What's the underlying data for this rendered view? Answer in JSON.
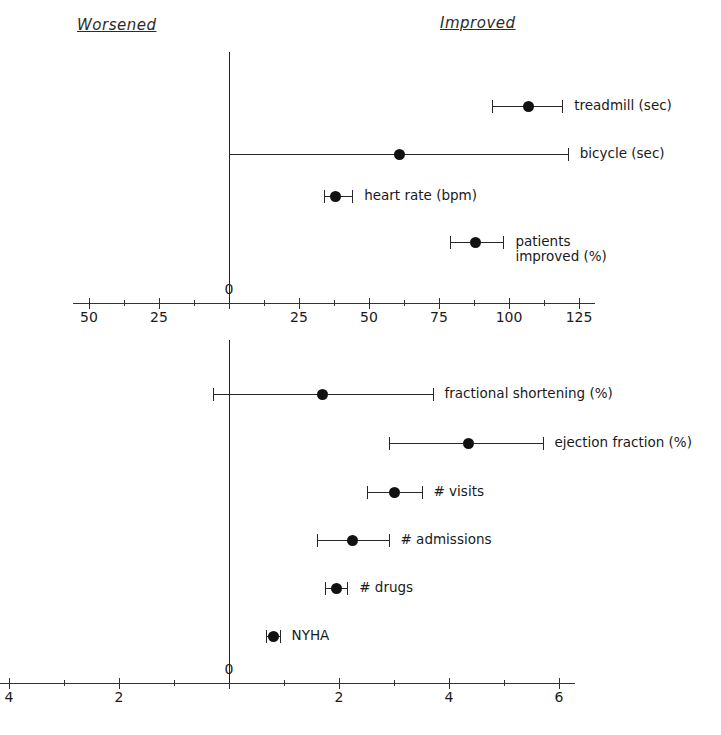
{
  "headers": {
    "left": "Worsened",
    "right": "Improved"
  },
  "chart_data": [
    {
      "type": "scatter",
      "id": "top-panel",
      "title": "",
      "subtitle": "",
      "xlabel": "",
      "ylabel": "",
      "orientation": "horizontal",
      "annotations": [
        "Worsened",
        "Improved"
      ],
      "grid": false,
      "legend": "none",
      "xlim": [
        -57,
        135
      ],
      "xticks_major": [
        -50,
        -25,
        0,
        25,
        50,
        75,
        100,
        125
      ],
      "xtick_labels": [
        "50",
        "25",
        "0",
        "25",
        "50",
        "75",
        "100",
        "125"
      ],
      "xticks_minor": [
        -37.5,
        -12.5,
        12.5,
        37.5,
        62.5,
        87.5,
        112.5
      ],
      "reference_line": 0,
      "points": [
        {
          "label": "treadmill (sec)",
          "value": 107,
          "low": 94,
          "high": 119
        },
        {
          "label": "bicycle (sec)",
          "value": 61,
          "low": 0,
          "high": 121
        },
        {
          "label": "heart rate (bpm)",
          "value": 38,
          "low": 34,
          "high": 44
        },
        {
          "label": "patients\nimproved (%)",
          "value": 88,
          "low": 79,
          "high": 98
        }
      ]
    },
    {
      "type": "scatter",
      "id": "bottom-panel",
      "title": "",
      "subtitle": "",
      "xlabel": "",
      "ylabel": "",
      "orientation": "horizontal",
      "grid": false,
      "legend": "none",
      "xlim": [
        -4.2,
        6.2
      ],
      "xticks_major": [
        -4,
        -2,
        0,
        2,
        4,
        6
      ],
      "xtick_labels": [
        "4",
        "2",
        "0",
        "2",
        "4",
        "6"
      ],
      "xticks_minor": [
        -3,
        -1,
        1,
        3,
        5
      ],
      "reference_line": 0,
      "points": [
        {
          "label": "fractional shortening (%)",
          "value": 1.7,
          "low": -0.3,
          "high": 3.7
        },
        {
          "label": "ejection fraction (%)",
          "value": 4.35,
          "low": 2.9,
          "high": 5.7
        },
        {
          "label": "# visits",
          "value": 3.0,
          "low": 2.5,
          "high": 3.5
        },
        {
          "label": "# admissions",
          "value": 2.25,
          "low": 1.6,
          "high": 2.9
        },
        {
          "label": "# drugs",
          "value": 1.95,
          "low": 1.75,
          "high": 2.15
        },
        {
          "label": "NYHA",
          "value": 0.8,
          "low": 0.68,
          "high": 0.92
        }
      ]
    }
  ],
  "geometry": {
    "top": {
      "zero_x": 229,
      "px_per_unit": 2.8,
      "axis_y": 303,
      "rows_y": [
        96,
        144,
        186,
        232
      ],
      "label_gap": 12,
      "tick_label_y": 309
    },
    "bottom": {
      "zero_x": 229,
      "px_per_unit": 55,
      "axis_y": 683,
      "rows_y": [
        384,
        433,
        482,
        530,
        578,
        626
      ],
      "label_gap": 12,
      "tick_label_y": 689
    }
  }
}
